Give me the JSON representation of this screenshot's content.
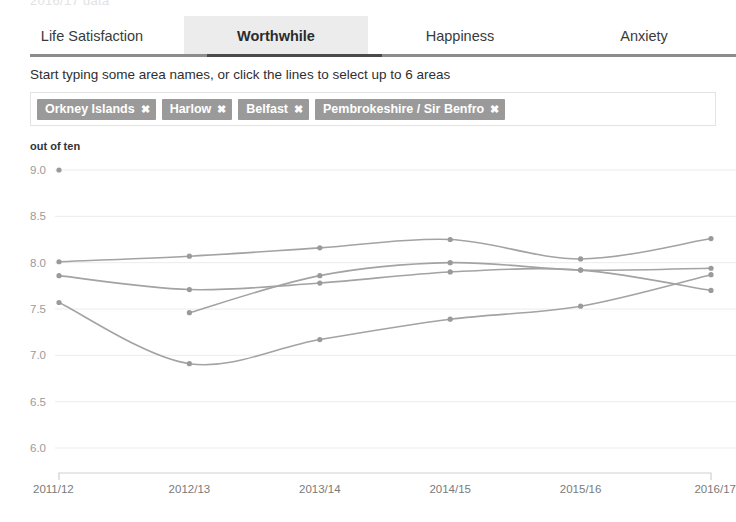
{
  "page": {
    "top_cut_text": "2016/17 data"
  },
  "tabs": {
    "items": [
      {
        "label": "Life Satisfaction",
        "active": false
      },
      {
        "label": "Worthwhile",
        "active": true
      },
      {
        "label": "Happiness",
        "active": false
      },
      {
        "label": "Anxiety",
        "active": false
      }
    ]
  },
  "instruction": {
    "text": "Start typing some area names, or click the lines to select up to 6 areas"
  },
  "selection": {
    "placeholder": "",
    "input_value": "",
    "close_glyph": "✖",
    "pills": [
      {
        "label": "Orkney Islands"
      },
      {
        "label": "Harlow"
      },
      {
        "label": "Belfast"
      },
      {
        "label": "Pembrokeshire / Sir Benfro"
      }
    ]
  },
  "chart_data": {
    "type": "line",
    "title": "",
    "subtitle": "",
    "xlabel": "",
    "ylabel": "out of ten",
    "unit_label": "out of ten",
    "categories": [
      "2011/12",
      "2012/13",
      "2013/14",
      "2014/15",
      "2015/16",
      "2016/17"
    ],
    "ylim": [
      5.75,
      9.15
    ],
    "yticks": [
      9.0,
      8.5,
      8.0,
      7.5,
      7.0,
      6.5,
      6.0
    ],
    "ytick_labels": [
      "9.0",
      "8.5",
      "8.0",
      "7.5",
      "7.0",
      "6.5",
      "6.0"
    ],
    "grid": true,
    "legend": "none",
    "line_color": "#a3a3a3",
    "marker_color": "#9a9a9a",
    "series": [
      {
        "name": "Orkney Islands",
        "values": [
          8.01,
          8.07,
          8.16,
          8.25,
          8.04,
          8.26
        ]
      },
      {
        "name": "Harlow",
        "values": [
          7.86,
          7.71,
          7.78,
          7.9,
          7.92,
          7.7
        ]
      },
      {
        "name": "Belfast",
        "values": [
          7.57,
          6.91,
          7.17,
          7.39,
          7.53,
          7.87
        ]
      },
      {
        "name": "Pembrokeshire / Sir Benfro",
        "values": [
          null,
          7.46,
          7.86,
          8.0,
          7.92,
          7.94
        ]
      }
    ],
    "stray_marker": {
      "x_category": "2011/12",
      "y": 9.0
    }
  }
}
